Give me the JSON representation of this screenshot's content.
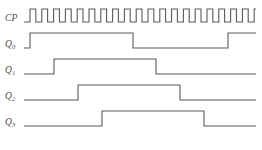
{
  "figure": {
    "kind": "digital-timing-diagram",
    "background_color": "#ffffff",
    "trace_color": "#5a5a5a",
    "label_color": "#4a4a4a",
    "trace_width": 1.1
  },
  "geometry": {
    "width": 262,
    "height": 150,
    "label_x": 5,
    "trace_start_x": 24,
    "trace_end_x": 256,
    "unit_width": 11.6
  },
  "signals": [
    {
      "name": "CP",
      "label_base": "CP",
      "label_sub": "",
      "label_y": 22,
      "row_low_y": 22,
      "row_high_y": 9,
      "transitions": [
        0,
        0.5,
        1,
        1.5,
        2,
        2.5,
        3,
        3.5,
        4,
        4.5,
        5,
        5.5,
        6,
        6.5,
        7,
        7.5,
        8,
        8.5,
        9,
        9.5,
        10,
        10.5,
        11,
        11.5,
        12,
        12.5,
        13,
        13.5,
        14,
        14.5,
        15,
        15.5,
        16,
        16.5,
        17,
        17.5,
        18,
        18.5,
        19,
        19.5
      ],
      "start_level": 0
    },
    {
      "name": "Q0",
      "label_base": "Q",
      "label_sub": "0",
      "label_y": 48,
      "row_low_y": 48,
      "row_high_y": 33,
      "start_level": 0
    },
    {
      "name": "Q1",
      "label_base": "Q",
      "label_sub": "1",
      "label_y": 74,
      "row_low_y": 74,
      "row_high_y": 59,
      "start_level": 0
    },
    {
      "name": "Q2",
      "label_base": "Q",
      "label_sub": "2",
      "label_y": 100,
      "row_low_y": 100,
      "row_high_y": 85,
      "start_level": 0
    },
    {
      "name": "Q3",
      "label_base": "Q",
      "label_sub": "3",
      "label_y": 126,
      "row_low_y": 126,
      "row_high_y": 111,
      "start_level": 0
    }
  ],
  "chart_data": {
    "type": "line",
    "title": "",
    "xlabel": "",
    "ylabel": "",
    "legend": [
      "CP",
      "Q0",
      "Q1",
      "Q2",
      "Q3"
    ],
    "clock_pulse_count": 10,
    "cp_edges_x": [
      24,
      30,
      35.8,
      41.8,
      47.6,
      53.6,
      59.4,
      65.4,
      71.2,
      77.2,
      83,
      89,
      94.8,
      100.8,
      106.6,
      112.6,
      118.4,
      124.4,
      130.2,
      136.2,
      142,
      148,
      153.8,
      159.8,
      165.6,
      171.6,
      177.4,
      183.4,
      189.2,
      195.2,
      201,
      207,
      212.8,
      218.8,
      224.6,
      230.6,
      236.4,
      242.4,
      248.2,
      254.2
    ],
    "series": [
      {
        "name": "CP",
        "segments_x": [
          24,
          30,
          30,
          35.8,
          35.8,
          41.8,
          41.8,
          47.6,
          47.6,
          53.6,
          53.6,
          59.4,
          59.4,
          65.4,
          65.4,
          71.2,
          71.2,
          77.2,
          77.2,
          83,
          83,
          89,
          89,
          94.8,
          94.8,
          100.8,
          100.8,
          106.6,
          106.6,
          112.6,
          112.6,
          118.4,
          118.4,
          124.4,
          124.4,
          130.2,
          130.2,
          136.2,
          136.2,
          142,
          142,
          148,
          148,
          153.8,
          153.8,
          159.8,
          159.8,
          165.6,
          165.6,
          171.6,
          171.6,
          177.4,
          177.4,
          183.4,
          183.4,
          189.2,
          189.2,
          195.2,
          195.2,
          201,
          201,
          207,
          207,
          212.8,
          212.8,
          218.8,
          218.8,
          224.6,
          224.6,
          230.6,
          230.6,
          236.4,
          236.4,
          242.4,
          242.4,
          248.2,
          248.2,
          256
        ],
        "levels": [
          0,
          1,
          0,
          1,
          0,
          1,
          0,
          1,
          0,
          1,
          0,
          1,
          0,
          1,
          0,
          1,
          0,
          1,
          0,
          1,
          0,
          1,
          0,
          1,
          0,
          1,
          0,
          1,
          0,
          1,
          0,
          1,
          0,
          1,
          0,
          1,
          0,
          1,
          0,
          0
        ]
      },
      {
        "name": "Q0",
        "edges_x": [
          30,
          133,
          228
        ],
        "start_level": 0,
        "end_x": 256
      },
      {
        "name": "Q1",
        "edges_x": [
          54,
          156
        ],
        "start_level": 0,
        "end_x": 256
      },
      {
        "name": "Q2",
        "edges_x": [
          78,
          180
        ],
        "start_level": 0,
        "end_x": 256
      },
      {
        "name": "Q3",
        "edges_x": [
          102,
          204
        ],
        "start_level": 0,
        "end_x": 256
      }
    ]
  }
}
